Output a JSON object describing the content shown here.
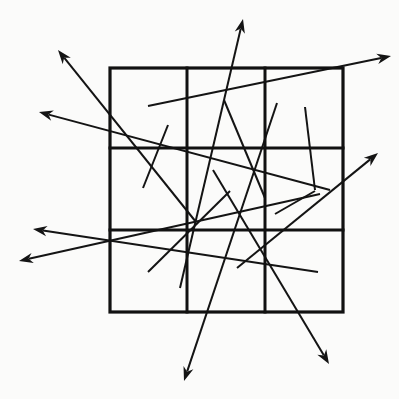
{
  "figure": {
    "canvas": {
      "width": 399,
      "height": 399
    },
    "background_color": "#fbfbfa",
    "stroke_color": "#141414"
  },
  "grid": {
    "name": "three-by-three-grid",
    "color": "#111111",
    "outer_stroke_width": 3.2,
    "inner_stroke_width": 3.0,
    "bounds": {
      "left": 110,
      "top": 68,
      "right": 343,
      "bottom": 312
    },
    "vertical_lines": [
      187,
      265
    ],
    "horizontal_lines": [
      148,
      230
    ],
    "cell_count": 9,
    "rows": 3,
    "columns": 3
  },
  "strokes": {
    "stroke_width": 2.0,
    "arrow_head_length": 14,
    "arrow_head_half_width": 5.2,
    "arrows": [
      {
        "id": "arrow-up-left-long",
        "label": "arrow pointing up-left out of grid",
        "from": {
          "x": 196,
          "y": 222
        },
        "to": {
          "x": 58,
          "y": 50
        },
        "head_at": "to"
      },
      {
        "id": "arrow-left-upper",
        "label": "arrow pointing left from mid grid",
        "from": {
          "x": 330,
          "y": 190
        },
        "to": {
          "x": 39,
          "y": 112
        },
        "head_at": "to"
      },
      {
        "id": "arrow-up-center",
        "label": "arrow pointing up out of top of grid",
        "from": {
          "x": 180,
          "y": 288
        },
        "to": {
          "x": 243,
          "y": 19
        },
        "head_at": "to"
      },
      {
        "id": "arrow-right-top",
        "label": "arrow pointing right out of top-right of grid",
        "from": {
          "x": 148,
          "y": 106
        },
        "to": {
          "x": 391,
          "y": 56
        },
        "head_at": "to"
      },
      {
        "id": "arrow-right-middle",
        "label": "arrow pointing up-right out of right side",
        "from": {
          "x": 237,
          "y": 268
        },
        "to": {
          "x": 378,
          "y": 153
        },
        "head_at": "to"
      },
      {
        "id": "arrow-left-lower-a",
        "label": "arrow pointing left below middle band",
        "from": {
          "x": 318,
          "y": 272
        },
        "to": {
          "x": 33,
          "y": 229
        },
        "head_at": "to"
      },
      {
        "id": "arrow-left-lower-b",
        "label": "arrow pointing down-left at lower left",
        "from": {
          "x": 320,
          "y": 194
        },
        "to": {
          "x": 19,
          "y": 261
        },
        "head_at": "to"
      },
      {
        "id": "arrow-down-left-bottom",
        "label": "arrow pointing down-left out of bottom of grid",
        "from": {
          "x": 277,
          "y": 103
        },
        "to": {
          "x": 184,
          "y": 381
        },
        "head_at": "to"
      },
      {
        "id": "arrow-down-right-bottom",
        "label": "arrow pointing down-right out of bottom of grid",
        "from": {
          "x": 213,
          "y": 170
        },
        "to": {
          "x": 329,
          "y": 364
        },
        "head_at": "to"
      }
    ],
    "plain_lines": [
      {
        "id": "line-upper-middle-descending",
        "label": "short line from top-centre cell descending right",
        "from": {
          "x": 224,
          "y": 100
        },
        "to": {
          "x": 265,
          "y": 198
        }
      },
      {
        "id": "line-upper-left-descending",
        "label": "short line descending into left-middle cell",
        "from": {
          "x": 168,
          "y": 125
        },
        "to": {
          "x": 143,
          "y": 188
        }
      },
      {
        "id": "line-right-upper-descending",
        "label": "line from right-top cell descending left",
        "from": {
          "x": 305,
          "y": 107
        },
        "to": {
          "x": 315,
          "y": 190
        }
      },
      {
        "id": "line-center-ascending",
        "label": "line ascending right through centre cell",
        "from": {
          "x": 148,
          "y": 272
        },
        "to": {
          "x": 230,
          "y": 191
        }
      },
      {
        "id": "line-right-of-center",
        "label": "short line right of centre",
        "from": {
          "x": 275,
          "y": 214
        },
        "to": {
          "x": 315,
          "y": 191
        }
      }
    ]
  }
}
